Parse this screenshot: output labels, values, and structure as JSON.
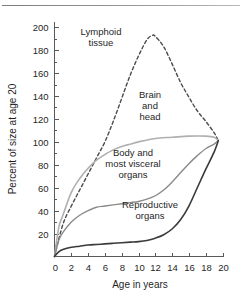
{
  "figure": {
    "title": "",
    "has_top_rule": true
  },
  "chart_data": {
    "type": "line",
    "title": "",
    "subtitle": "",
    "xlabel": "Age in years",
    "ylabel": "Percent of size at age 20",
    "xlim": [
      0,
      20
    ],
    "ylim": [
      0,
      205
    ],
    "xticks": [
      0,
      2,
      4,
      6,
      8,
      10,
      12,
      14,
      16,
      18,
      20
    ],
    "xtick_labels": [
      "0",
      "2",
      "4",
      "6",
      "8",
      "10",
      "12",
      "14",
      "16",
      "18",
      "20"
    ],
    "yticks": [
      20,
      40,
      60,
      80,
      100,
      120,
      140,
      160,
      180,
      200
    ],
    "ytick_labels": [
      "20",
      "40",
      "60",
      "80",
      "100",
      "120",
      "140",
      "160",
      "180",
      "200"
    ],
    "grid": false,
    "legend_position": "inline-annotations",
    "series": [
      {
        "name": "Lymphoid tissue",
        "style": "dashed",
        "color": "#4a4a4a",
        "x": [
          0,
          1,
          2,
          3,
          4,
          5,
          6,
          7,
          8,
          9,
          10,
          11,
          11.7,
          12,
          13,
          14,
          15,
          16,
          17,
          18,
          19,
          19.5
        ],
        "values": [
          0,
          28,
          44,
          58,
          72,
          86,
          100,
          118,
          138,
          158,
          175,
          189,
          193,
          192,
          183,
          168,
          152,
          139,
          127,
          118,
          108,
          101
        ]
      },
      {
        "name": "Brain and head",
        "style": "solid",
        "color": "#b0b0b0",
        "x": [
          0,
          0.5,
          1,
          2,
          3,
          4,
          5,
          6,
          7,
          8,
          9,
          10,
          12,
          14,
          16,
          18,
          19,
          19.5
        ],
        "values": [
          0,
          25,
          36,
          56,
          68,
          77,
          84,
          89,
          93,
          96,
          98,
          100,
          103,
          104,
          105,
          105,
          104,
          101
        ]
      },
      {
        "name": "Body and most visceral organs",
        "style": "solid",
        "color": "#8a8a8a",
        "x": [
          0,
          0.5,
          1,
          2,
          3,
          4,
          5,
          6,
          7,
          8,
          9,
          10,
          11,
          12,
          13,
          14,
          15,
          16,
          17,
          18,
          19,
          19.5
        ],
        "values": [
          0,
          14,
          21,
          30,
          36,
          40,
          43,
          44,
          45,
          46,
          47,
          48,
          50,
          53,
          58,
          65,
          73,
          81,
          88,
          94,
          98,
          101
        ]
      },
      {
        "name": "Reproductive organs",
        "style": "solid",
        "color": "#3a3a3a",
        "x": [
          0,
          0.5,
          1,
          2,
          3,
          4,
          5,
          6,
          7,
          8,
          9,
          10,
          11,
          12,
          13,
          14,
          15,
          16,
          17,
          18,
          19,
          19.5
        ],
        "values": [
          0,
          4,
          6,
          8,
          9,
          10,
          10.5,
          11,
          11.5,
          12,
          12.5,
          13,
          14,
          16,
          19,
          24,
          32,
          44,
          60,
          76,
          91,
          101
        ]
      }
    ],
    "annotations": [
      {
        "text_lines": [
          "Lymphoid",
          "tissue"
        ],
        "x_px": 101,
        "y_px": 35,
        "anchor": "middle"
      },
      {
        "text_lines": [
          "Brain",
          "and",
          "head"
        ],
        "x_px": 150,
        "y_px": 98,
        "anchor": "middle"
      },
      {
        "text_lines": [
          "Body and",
          "most visceral",
          "organs"
        ],
        "x_px": 133,
        "y_px": 156,
        "anchor": "middle"
      },
      {
        "text_lines": [
          "Reproductive",
          "organs"
        ],
        "x_px": 150,
        "y_px": 208,
        "anchor": "middle"
      }
    ]
  }
}
